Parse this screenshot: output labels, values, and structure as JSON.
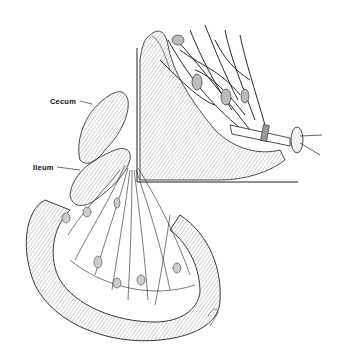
{
  "figure": {
    "labels": {
      "cecum": "Cecum",
      "ileum": "Ileum"
    },
    "colors": {
      "ink": "#111111",
      "background": "#ffffff",
      "hatch": "#555555"
    },
    "inset": {
      "description": "Enlarged view of mesenteric vessels with ligature"
    }
  }
}
